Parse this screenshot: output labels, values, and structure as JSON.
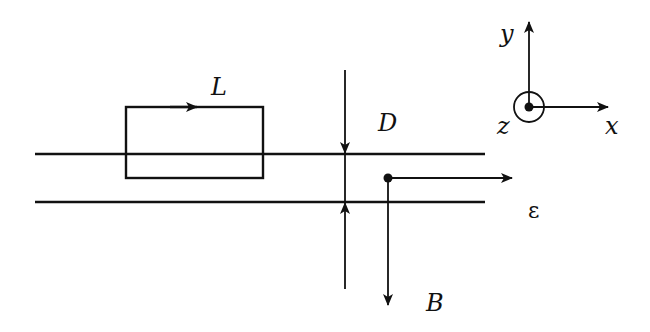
{
  "diagram": {
    "labels": {
      "loop": "L",
      "separation": "D",
      "electric_field": "ε",
      "magnetic_field": "B",
      "axis_x": "x",
      "axis_y": "y",
      "axis_z": "z"
    },
    "colors": {
      "stroke": "#111111",
      "background": "#ffffff"
    }
  }
}
